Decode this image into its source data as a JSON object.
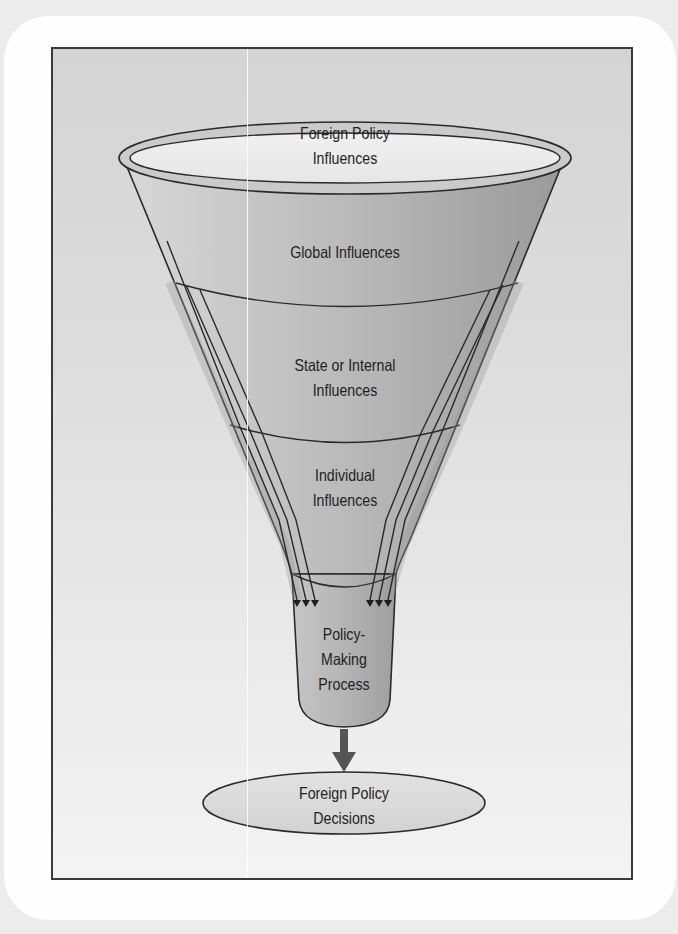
{
  "diagram": {
    "type": "funnel",
    "rim": {
      "label_line1": "Foreign Policy",
      "label_line2": "Influences"
    },
    "levels": [
      {
        "label_line1": "Global Influences",
        "label_line2": ""
      },
      {
        "label_line1": "State or Internal",
        "label_line2": "Influences"
      },
      {
        "label_line1": "Individual",
        "label_line2": "Influences"
      }
    ],
    "spout": {
      "label_line1": "Policy-",
      "label_line2": "Making",
      "label_line3": "Process"
    },
    "output": {
      "label_line1": "Foreign Policy",
      "label_line2": "Decisions"
    },
    "arrows": {
      "left_count": 3,
      "right_count": 3,
      "output_arrow": "down-arrow"
    },
    "colors": {
      "outline": "#2a2a2a",
      "funnel_light": "#d0d0d0",
      "funnel_dark": "#9e9e9e",
      "rim_fill": "#c9c9c9",
      "opening_fill": "#ececec",
      "frame_bg": "#d6d6d6",
      "arrow": "#555555",
      "ellipse_fill": "#d9d9d9"
    }
  }
}
